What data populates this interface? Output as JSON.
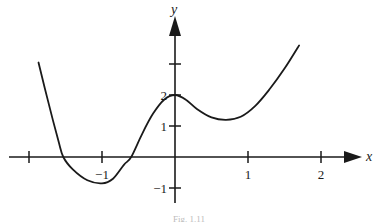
{
  "figure": {
    "caption": "Fig. 1.11"
  },
  "chart_data": {
    "type": "line",
    "title": "",
    "xlabel": "x",
    "ylabel": "y",
    "xlim": [
      -2.2,
      2.5
    ],
    "ylim": [
      -1.3,
      3.7
    ],
    "grid": false,
    "legend": null,
    "x_ticks": [
      {
        "value": -2,
        "label": ""
      },
      {
        "value": -1,
        "label": "−1"
      },
      {
        "value": 1,
        "label": "1"
      },
      {
        "value": 2,
        "label": "2"
      }
    ],
    "y_ticks": [
      {
        "value": -1,
        "label": "−1"
      },
      {
        "value": 1,
        "label": "1"
      },
      {
        "value": 2,
        "label": "2"
      },
      {
        "value": 3,
        "label": ""
      }
    ],
    "series": [
      {
        "name": "f(x)",
        "x": [
          -1.87,
          -1.75,
          -1.6,
          -1.53,
          -1.4,
          -1.2,
          -1.0,
          -0.85,
          -0.7,
          -0.6,
          -0.45,
          -0.3,
          -0.15,
          0.0,
          0.15,
          0.3,
          0.5,
          0.7,
          0.9,
          1.1,
          1.3,
          1.5,
          1.7
        ],
        "y": [
          3.05,
          1.9,
          0.55,
          0.0,
          -0.4,
          -0.75,
          -0.85,
          -0.7,
          -0.25,
          0.0,
          0.75,
          1.4,
          1.85,
          2.0,
          1.85,
          1.55,
          1.28,
          1.2,
          1.3,
          1.65,
          2.2,
          2.85,
          3.6
        ]
      }
    ],
    "features": {
      "local_max": [
        0,
        2
      ],
      "local_min_left": [
        -1,
        -0.85
      ],
      "local_min_right": [
        0.7,
        1.2
      ],
      "x_intercepts": [
        -1.53,
        -0.6
      ]
    }
  }
}
